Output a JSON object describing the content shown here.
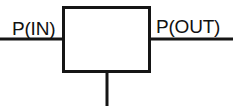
{
  "diagram": {
    "type": "schematic",
    "title": "",
    "background_color": "#ffffff",
    "line_color": "#151515",
    "fill_color": "#ffffff",
    "labels": {
      "inlet": "P(IN)",
      "outlet": "P(OUT)"
    },
    "geometry": {
      "canvas_width": 235,
      "canvas_height": 106,
      "box": {
        "x": 62,
        "y": 6,
        "width": 88,
        "height": 66,
        "stroke_width": 3
      },
      "inlet_line": {
        "x1": 0,
        "y1": 39,
        "x2": 62,
        "y2": 39,
        "stroke_width": 3
      },
      "outlet_line": {
        "x1": 150,
        "y1": 39,
        "x2": 233,
        "y2": 39,
        "stroke_width": 3
      },
      "stem_line": {
        "x1": 107,
        "y1": 72,
        "x2": 107,
        "y2": 106,
        "stroke_width": 3
      },
      "inlet_label_pos": {
        "x": 12,
        "y": 35
      },
      "outlet_label_pos": {
        "x": 156,
        "y": 33
      }
    }
  }
}
